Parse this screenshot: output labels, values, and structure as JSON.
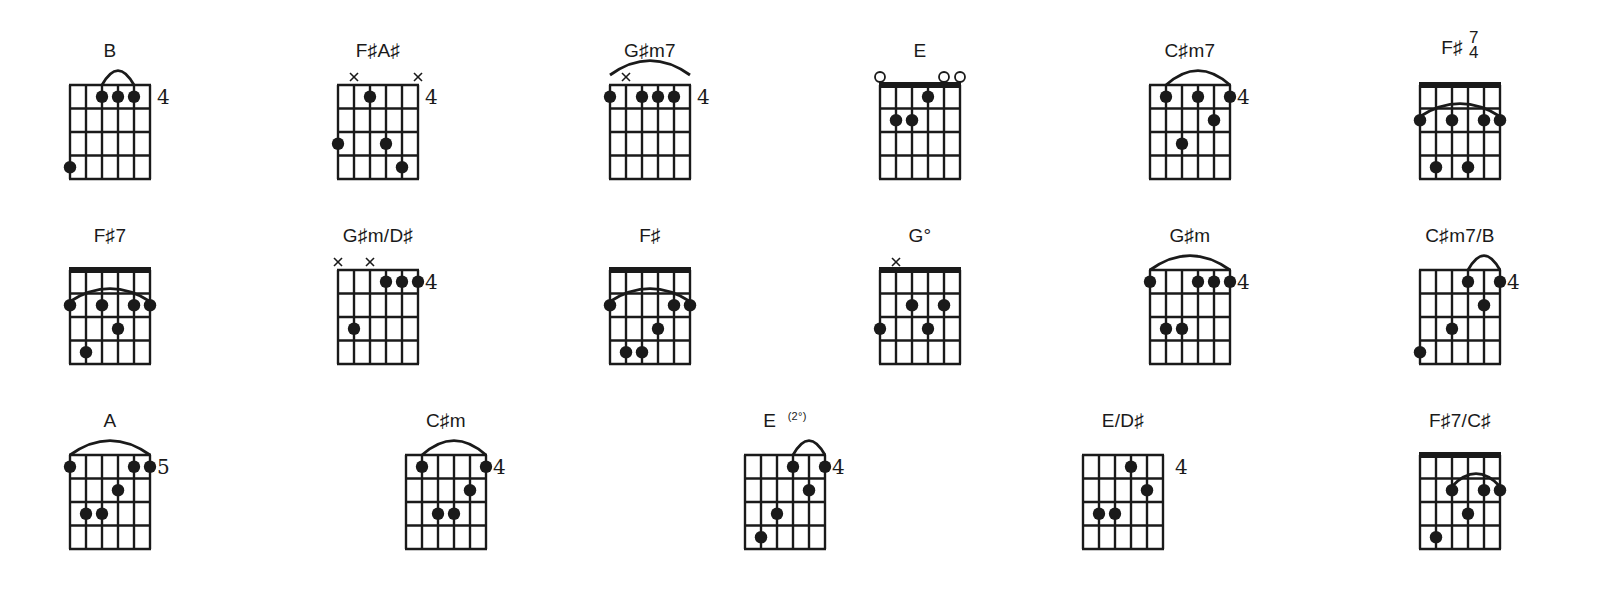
{
  "page": {
    "colors": {
      "ink": "#1a1a1a",
      "background": "#ffffff"
    }
  },
  "chords": [
    {
      "name": "B",
      "x": 70,
      "y": 40,
      "nut": false,
      "fret": "4",
      "markers": [],
      "arc": [
        2,
        4,
        "top"
      ],
      "dots": [
        [
          2,
          1
        ],
        [
          3,
          1
        ],
        [
          4,
          1
        ],
        [
          0,
          4
        ]
      ]
    },
    {
      "name": "F♯A♯",
      "x": 338,
      "y": 40,
      "nut": false,
      "fret": "4",
      "markers": [
        [
          1,
          "x"
        ],
        [
          5,
          "x"
        ]
      ],
      "arc": null,
      "dots": [
        [
          2,
          1
        ],
        [
          0,
          3
        ],
        [
          3,
          3
        ],
        [
          4,
          4
        ]
      ]
    },
    {
      "name": "G♯m7",
      "x": 610,
      "y": 40,
      "nut": false,
      "fret": "4",
      "markers": [
        [
          1,
          "x"
        ]
      ],
      "arc": [
        0,
        5,
        "high"
      ],
      "dots": [
        [
          0,
          1
        ],
        [
          2,
          1
        ],
        [
          3,
          1
        ],
        [
          4,
          1
        ]
      ]
    },
    {
      "name": "E",
      "x": 880,
      "y": 40,
      "nut": true,
      "fret": "",
      "markers": [
        [
          0,
          "o"
        ],
        [
          4,
          "o"
        ],
        [
          5,
          "o"
        ]
      ],
      "arc": null,
      "dots": [
        [
          3,
          1
        ],
        [
          1,
          2
        ],
        [
          2,
          2
        ]
      ]
    },
    {
      "name": "C♯m7",
      "x": 1150,
      "y": 40,
      "nut": false,
      "fret": "4",
      "markers": [],
      "arc": [
        1,
        5,
        "top"
      ],
      "dots": [
        [
          1,
          1
        ],
        [
          3,
          1
        ],
        [
          5,
          1
        ],
        [
          4,
          2
        ],
        [
          2,
          3
        ]
      ]
    },
    {
      "name": "F♯ 7/4",
      "x": 1420,
      "y": 40,
      "nut": true,
      "fret": "",
      "markers": [],
      "arc": [
        0,
        5,
        "inner"
      ],
      "dots": [
        [
          0,
          2
        ],
        [
          2,
          2
        ],
        [
          4,
          2
        ],
        [
          5,
          2
        ],
        [
          1,
          4
        ],
        [
          3,
          4
        ]
      ],
      "name_main": "F♯",
      "name_top": "7",
      "name_bottom": "4"
    },
    {
      "name": "F♯7",
      "x": 70,
      "y": 225,
      "nut": true,
      "fret": "",
      "markers": [],
      "arc": [
        0,
        5,
        "inner"
      ],
      "dots": [
        [
          0,
          2
        ],
        [
          2,
          2
        ],
        [
          4,
          2
        ],
        [
          5,
          2
        ],
        [
          3,
          3
        ],
        [
          1,
          4
        ]
      ]
    },
    {
      "name": "G♯m/D♯",
      "x": 338,
      "y": 225,
      "nut": false,
      "fret": "4",
      "markers": [
        [
          0,
          "x"
        ],
        [
          2,
          "x"
        ]
      ],
      "arc": null,
      "dots": [
        [
          3,
          1
        ],
        [
          4,
          1
        ],
        [
          5,
          1
        ],
        [
          1,
          3
        ]
      ]
    },
    {
      "name": "F♯",
      "x": 610,
      "y": 225,
      "nut": true,
      "fret": "",
      "markers": [],
      "arc": [
        0,
        5,
        "inner"
      ],
      "dots": [
        [
          0,
          2
        ],
        [
          4,
          2
        ],
        [
          5,
          2
        ],
        [
          3,
          3
        ],
        [
          1,
          4
        ],
        [
          2,
          4
        ]
      ]
    },
    {
      "name": "G°",
      "x": 880,
      "y": 225,
      "nut": true,
      "fret": "",
      "markers": [
        [
          1,
          "x"
        ]
      ],
      "arc": null,
      "dots": [
        [
          2,
          2
        ],
        [
          4,
          2
        ],
        [
          0,
          3
        ],
        [
          3,
          3
        ]
      ]
    },
    {
      "name": "G♯m",
      "x": 1150,
      "y": 225,
      "nut": false,
      "fret": "4",
      "markers": [],
      "arc": [
        0,
        5,
        "top"
      ],
      "dots": [
        [
          0,
          1
        ],
        [
          3,
          1
        ],
        [
          4,
          1
        ],
        [
          5,
          1
        ],
        [
          1,
          3
        ],
        [
          2,
          3
        ]
      ]
    },
    {
      "name": "C♯m7/B",
      "x": 1420,
      "y": 225,
      "nut": false,
      "fret": "4",
      "markers": [],
      "arc": [
        3,
        5,
        "top"
      ],
      "dots": [
        [
          3,
          1
        ],
        [
          5,
          1
        ],
        [
          4,
          2
        ],
        [
          2,
          3
        ],
        [
          0,
          4
        ]
      ]
    },
    {
      "name": "A",
      "x": 70,
      "y": 410,
      "nut": false,
      "fret": "5",
      "markers": [],
      "arc": [
        0,
        5,
        "top"
      ],
      "dots": [
        [
          0,
          1
        ],
        [
          4,
          1
        ],
        [
          5,
          1
        ],
        [
          3,
          2
        ],
        [
          1,
          3
        ],
        [
          2,
          3
        ]
      ]
    },
    {
      "name": "C♯m",
      "x": 406,
      "y": 410,
      "nut": false,
      "fret": "4",
      "markers": [],
      "arc": [
        1,
        5,
        "top"
      ],
      "dots": [
        [
          1,
          1
        ],
        [
          5,
          1
        ],
        [
          4,
          2
        ],
        [
          2,
          3
        ],
        [
          3,
          3
        ]
      ]
    },
    {
      "name": "E (2°)",
      "x": 745,
      "y": 410,
      "nut": false,
      "fret": "4",
      "markers": [],
      "arc": [
        3,
        5,
        "top"
      ],
      "dots": [
        [
          3,
          1
        ],
        [
          5,
          1
        ],
        [
          4,
          2
        ],
        [
          2,
          3
        ],
        [
          1,
          4
        ]
      ],
      "name_main": "E",
      "name_sup": "(2°)"
    },
    {
      "name": "E/D♯",
      "x": 1083,
      "y": 410,
      "nut": false,
      "fret": "4",
      "fret_gap": true,
      "markers": [],
      "arc": null,
      "dots": [
        [
          3,
          1
        ],
        [
          4,
          2
        ],
        [
          1,
          3
        ],
        [
          2,
          3
        ]
      ]
    },
    {
      "name": "F♯7/C♯",
      "x": 1420,
      "y": 410,
      "nut": true,
      "fret": "",
      "markers": [],
      "arc": [
        2,
        5,
        "inner"
      ],
      "dots": [
        [
          2,
          2
        ],
        [
          4,
          2
        ],
        [
          5,
          2
        ],
        [
          3,
          3
        ],
        [
          1,
          4
        ]
      ]
    }
  ]
}
